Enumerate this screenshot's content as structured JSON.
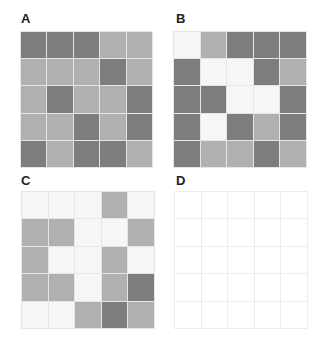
{
  "colors": {
    "dark": "#7d7d7d",
    "light": "#b0b0b0",
    "white": "#f6f6f6",
    "empty": "#ffffff"
  },
  "panels": [
    {
      "label": "A",
      "cells": [
        [
          "D",
          "D",
          "D",
          "L",
          "L"
        ],
        [
          "L",
          "L",
          "L",
          "D",
          "L"
        ],
        [
          "L",
          "D",
          "L",
          "L",
          "D"
        ],
        [
          "L",
          "L",
          "D",
          "L",
          "D"
        ],
        [
          "D",
          "L",
          "D",
          "D",
          "L"
        ]
      ]
    },
    {
      "label": "B",
      "cells": [
        [
          "W",
          "L",
          "D",
          "D",
          "D"
        ],
        [
          "D",
          "W",
          "W",
          "D",
          "L"
        ],
        [
          "D",
          "D",
          "W",
          "W",
          "D"
        ],
        [
          "D",
          "W",
          "D",
          "L",
          "D"
        ],
        [
          "D",
          "L",
          "L",
          "D",
          "L"
        ]
      ]
    },
    {
      "label": "C",
      "cells": [
        [
          "W",
          "W",
          "W",
          "L",
          "W"
        ],
        [
          "L",
          "L",
          "W",
          "W",
          "L"
        ],
        [
          "L",
          "W",
          "W",
          "L",
          "W"
        ],
        [
          "L",
          "L",
          "W",
          "L",
          "D"
        ],
        [
          "W",
          "W",
          "L",
          "D",
          "L"
        ]
      ]
    },
    {
      "label": "D",
      "cells": [
        [
          "E",
          "E",
          "E",
          "E",
          "E"
        ],
        [
          "E",
          "E",
          "E",
          "E",
          "E"
        ],
        [
          "E",
          "E",
          "E",
          "E",
          "E"
        ],
        [
          "E",
          "E",
          "E",
          "E",
          "E"
        ],
        [
          "E",
          "E",
          "E",
          "E",
          "E"
        ]
      ]
    }
  ]
}
